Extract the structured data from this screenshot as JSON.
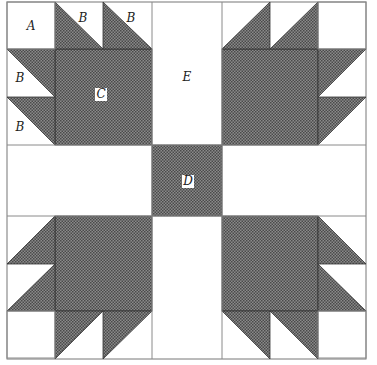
{
  "colors": {
    "background": "#ffffff",
    "shaded_fabric": "#6e6e6e",
    "outline": "#555555",
    "seam": "#222222"
  },
  "patch_labels": {
    "A": "A",
    "B": "B",
    "C": "C",
    "D": "D",
    "E": "E"
  },
  "pieces": [
    {
      "id": "A",
      "description": "corner square",
      "shaded": false
    },
    {
      "id": "B",
      "description": "half-square triangle unit",
      "shaded": "half"
    },
    {
      "id": "C",
      "description": "large paw square",
      "shaded": true
    },
    {
      "id": "D",
      "description": "center square",
      "shaded": true
    },
    {
      "id": "E",
      "description": "sashing rectangle",
      "shaded": false
    }
  ]
}
